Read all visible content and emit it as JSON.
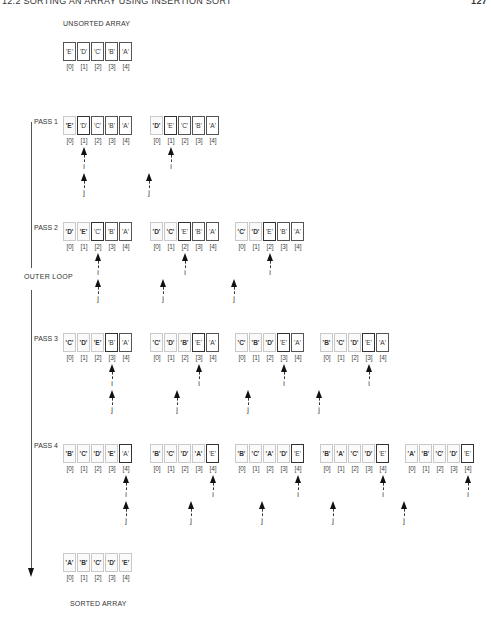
{
  "header": {
    "title": "12.2 SORTING AN ARRAY USING INSERTION SORT",
    "page_number": "127"
  },
  "unsorted": {
    "label": "UNSORTED ARRAY",
    "values": [
      "'E'",
      "'D'",
      "'C'",
      "'B'",
      "'A'"
    ]
  },
  "indices": [
    "[0]",
    "[1]",
    "[2]",
    "[3]",
    "[4]"
  ],
  "outer_loop_label": "OUTER LOOP",
  "pointer_labels": {
    "i": "i",
    "j": "j"
  },
  "passes": [
    {
      "label": "PASS 1",
      "steps": [
        {
          "values": [
            "'E'",
            "'D'",
            "'C'",
            "'B'",
            "'A'"
          ],
          "i": 1,
          "j": 1
        },
        {
          "values": [
            "'D'",
            "'E'",
            "'C'",
            "'B'",
            "'A'"
          ],
          "i": 1,
          "j": 0
        }
      ]
    },
    {
      "label": "PASS 2",
      "steps": [
        {
          "values": [
            "'D'",
            "'E'",
            "'C'",
            "'B'",
            "'A'"
          ],
          "i": 2,
          "j": 2
        },
        {
          "values": [
            "'D'",
            "'C'",
            "'E'",
            "'B'",
            "'A'"
          ],
          "i": 2,
          "j": 1
        },
        {
          "values": [
            "'C'",
            "'D'",
            "'E'",
            "'B'",
            "'A'"
          ],
          "i": 2,
          "j": 0
        }
      ]
    },
    {
      "label": "PASS 3",
      "steps": [
        {
          "values": [
            "'C'",
            "'D'",
            "'E'",
            "'B'",
            "'A'"
          ],
          "i": 3,
          "j": 3
        },
        {
          "values": [
            "'C'",
            "'D'",
            "'B'",
            "'E'",
            "'A'"
          ],
          "i": 3,
          "j": 2
        },
        {
          "values": [
            "'C'",
            "'B'",
            "'D'",
            "'E'",
            "'A'"
          ],
          "i": 3,
          "j": 1
        },
        {
          "values": [
            "'B'",
            "'C'",
            "'D'",
            "'E'",
            "'A'"
          ],
          "i": 3,
          "j": 0
        }
      ]
    },
    {
      "label": "PASS 4",
      "steps": [
        {
          "values": [
            "'B'",
            "'C'",
            "'D'",
            "'E'",
            "'A'"
          ],
          "i": 4,
          "j": 4
        },
        {
          "values": [
            "'B'",
            "'C'",
            "'D'",
            "'A'",
            "'E'"
          ],
          "i": 4,
          "j": 3
        },
        {
          "values": [
            "'B'",
            "'C'",
            "'A'",
            "'D'",
            "'E'"
          ],
          "i": 4,
          "j": 2
        },
        {
          "values": [
            "'B'",
            "'A'",
            "'C'",
            "'D'",
            "'E'"
          ],
          "i": 4,
          "j": 1
        },
        {
          "values": [
            "'A'",
            "'B'",
            "'C'",
            "'D'",
            "'E'"
          ],
          "i": 4,
          "j": 0
        }
      ]
    }
  ],
  "sorted": {
    "label": "SORTED ARRAY",
    "values": [
      "'A'",
      "'B'",
      "'C'",
      "'D'",
      "'E'"
    ]
  }
}
